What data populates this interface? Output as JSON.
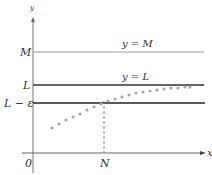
{
  "diagram": {
    "axes": {
      "y_axis_label": "y",
      "x_axis_label": "x",
      "origin_label": "0"
    },
    "lines": [
      {
        "id": "M",
        "left_label": "M",
        "right_label": "y = M",
        "color": "#9a9a9a"
      },
      {
        "id": "L",
        "left_label": "L",
        "right_label": "y = L",
        "color": "#333333"
      },
      {
        "id": "L-eps",
        "left_label": "L − ε",
        "color": "#222222"
      }
    ],
    "marker": {
      "label": "N"
    },
    "sequence": {
      "description": "increasing sequence of dots approaching L",
      "color": "#aaaaaa"
    }
  }
}
